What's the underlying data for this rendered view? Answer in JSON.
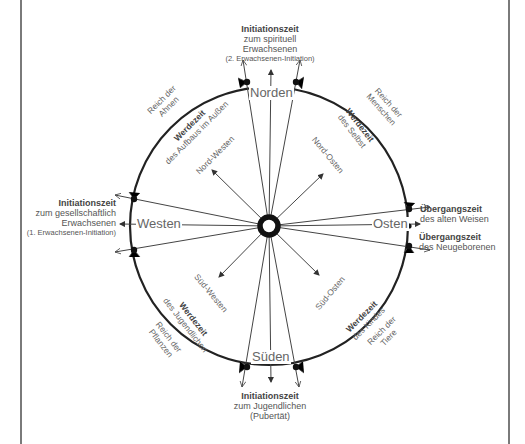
{
  "diagram": {
    "cardinal_directions": {
      "north": "Norden",
      "south": "Süden",
      "west": "Westen",
      "east": "Osten"
    },
    "intercardinal_directions": {
      "northwest": "Nord-Westen",
      "northeast": "Nord-Osten",
      "southwest": "Süd-Westen",
      "southeast": "Süd-Osten"
    },
    "initiation_north": {
      "title": "Initiationszeit",
      "line1": "zum spirituell",
      "line2": "Erwachsenen",
      "note": "(2. Erwachsenen-Initiation)"
    },
    "initiation_west": {
      "title": "Initiationszeit",
      "line1": "zum gesellschaftlich",
      "line2": "Erwachsenen",
      "note": "(1. Erwachsenen-Initiation)"
    },
    "initiation_south": {
      "title": "Initiationszeit",
      "line1": "zum Jugendlichen",
      "line2": "(Pubertät)"
    },
    "transition_east_upper": {
      "title": "Übergangszeit",
      "line1": "des alten Weisen"
    },
    "transition_east_lower": {
      "title": "Übergangszeit",
      "line1": "des Neugeborenen"
    },
    "quadrants": {
      "northwest": {
        "realm_line1": "Reich der",
        "realm_line2": "Ahnen",
        "werdezeit_title": "Werdezeit",
        "werdezeit_text": "des Aufbaus im Außen"
      },
      "northeast": {
        "realm_line1": "Reich der",
        "realm_line2": "Menschen",
        "werdezeit_title": "Werdezeit",
        "werdezeit_text": "des Selbst"
      },
      "southwest": {
        "realm_line1": "Reich der",
        "realm_line2": "Pflanzen",
        "werdezeit_title": "Werdezeit",
        "werdezeit_text": "des Jugendlichen"
      },
      "southeast": {
        "realm_line1": "Reich der",
        "realm_line2": "Tiere",
        "werdezeit_title": "Werdezeit",
        "werdezeit_text": "des Kindes"
      }
    },
    "colors": {
      "line": "#444444",
      "circle": "#222222",
      "text": "#555555",
      "frame": "#7a7a7a"
    }
  }
}
